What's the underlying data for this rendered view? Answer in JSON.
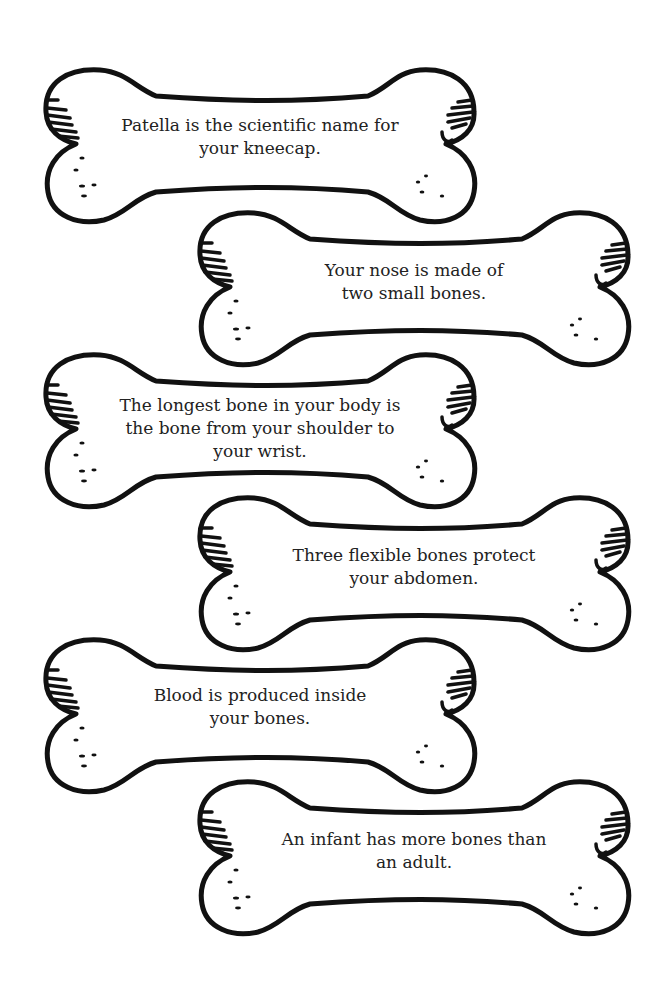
{
  "page": {
    "background": "#ffffff",
    "stroke_color": "#111111"
  },
  "bones": [
    {
      "text": "Patella is the scientific name for\nyour kneecap.",
      "x": 38,
      "y": 60,
      "text_offset": -8
    },
    {
      "text": "Your nose is made of\ntwo small bones.",
      "x": 192,
      "y": 203,
      "text_offset": 0
    },
    {
      "text": "The longest bone in your body is\nthe bone from your shoulder to\nyour wrist.",
      "x": 38,
      "y": 345,
      "text_offset": 0
    },
    {
      "text": "Three flexible bones protect\nyour abdomen.",
      "x": 192,
      "y": 488,
      "text_offset": 0
    },
    {
      "text": "Blood is produced inside\nyour bones.",
      "x": 38,
      "y": 630,
      "text_offset": -8
    },
    {
      "text": "An infant has more bones than\nan adult.",
      "x": 192,
      "y": 772,
      "text_offset": 0
    }
  ]
}
